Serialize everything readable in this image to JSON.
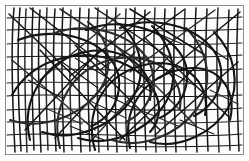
{
  "artwork": {
    "title": "Abstract Scribble Drawing",
    "medium": "black ink line drawing",
    "description": "Dense overlapping network of straight and curved black ink strokes filling a thin rectangular frame",
    "canvas": {
      "width": 249,
      "height": 161
    },
    "background_color": "#fdfdfc",
    "ink_color": "#141414",
    "frame": {
      "stroke_color": "#8e8e8e",
      "fill_color": "#fcfcfb",
      "x": 5.5,
      "y": 5.5,
      "width": 238,
      "height": 149
    },
    "strokes": {
      "vertical_bundle": [
        "M 14 8 C 11 40, 12 95, 15 152",
        "M 20 8 C 17 45, 18 100, 21 151",
        "M 26 9 C 24 50, 25 105, 27 152",
        "M 33 8 C 31 48, 32 100, 34 150",
        "M 40 10 C 37 52, 39 108, 41 152",
        "M 47 8 C 45 46, 46 100, 48 150",
        "M 55 9 C 52 50, 54 104, 56 151",
        "M 63 8 C 61 44, 62 98, 64 152",
        "M 71 10 C 69 52, 70 106, 72 150",
        "M 80 8 C 78 46, 79 102, 81 152",
        "M 89 9 C 87 50, 88 104, 90 151",
        "M 98 8 C 96 48, 97 100, 99 152",
        "M 107 10 C 105 52, 106 106, 108 150",
        "M 116 8 C 114 46, 115 100, 117 152",
        "M 126 9 C 124 50, 125 104, 127 151",
        "M 135 8 C 133 48, 134 102, 136 152",
        "M 145 10 C 143 52, 144 106, 146 150",
        "M 155 8 C 153 46, 154 100, 156 152",
        "M 165 9 C 163 50, 164 104, 166 151",
        "M 175 8 C 173 48, 174 102, 176 152",
        "M 185 10 C 183 52, 184 106, 186 150",
        "M 196 8 C 194 46, 195 100, 197 152",
        "M 207 9 C 205 50, 206 104, 208 151",
        "M 218 8 C 216 48, 217 102, 219 152",
        "M 229 10 C 227 52, 228 106, 230 150",
        "M 238 9 C 236 50, 237 104, 239 151"
      ],
      "horizontal_bundle": [
        "M 7 18 C 60 15, 150 22, 242 17",
        "M 7 30 C 70 27, 160 34, 242 29",
        "M 7 44 C 55 40, 140 48, 242 43",
        "M 7 57 C 80 54, 170 61, 242 55",
        "M 7 70 C 60 66, 150 74, 242 69",
        "M 7 83 C 75 80, 165 87, 242 82",
        "M 7 96 C 55 92, 145 100, 242 95",
        "M 7 110 C 80 106, 170 114, 242 108",
        "M 7 122 C 60 119, 150 127, 242 121",
        "M 7 135 C 75 131, 165 140, 242 134",
        "M 7 146 C 60 143, 150 150, 242 145"
      ],
      "diagonal_strokes": [
        "M 9 14 L 78 80",
        "M 30 8 L 110 70",
        "M 60 9 L 140 62",
        "M 95 8 L 170 58",
        "M 130 9 L 205 55",
        "M 12 60 L 95 130",
        "M 40 50 L 125 140",
        "M 75 45 L 160 130",
        "M 110 40 L 195 125",
        "M 145 38 L 230 118",
        "M 240 12 L 160 78",
        "M 215 10 L 130 72",
        "M 185 9 L 100 70",
        "M 150 12 L 70 76",
        "M 120 14 L 40 80",
        "M 238 62 L 155 135",
        "M 205 58 L 120 140",
        "M 170 55 L 90 142",
        "M 135 52 L 55 138",
        "M 100 50 L 25 130"
      ],
      "curve_loops": [
        "M 12 95 C 35 55, 85 48, 120 62 C 155 76, 170 110, 150 132",
        "M 30 140 C 20 100, 45 60, 85 52 C 125 44, 155 70, 150 100",
        "M 60 148 C 50 110, 70 70, 110 60 C 150 50, 185 72, 180 108",
        "M 95 150 C 85 115, 100 78, 140 66 C 180 54, 212 80, 205 115",
        "M 130 148 C 122 112, 140 80, 178 70 C 216 60, 238 88, 230 120",
        "M 10 120 C 40 130, 75 118, 95 96 C 115 74, 112 40, 88 22",
        "M 42 132 C 72 142, 108 128, 128 104 C 148 80, 144 46, 120 24",
        "M 78 138 C 108 148, 144 132, 162 108 C 180 84, 176 50, 152 26",
        "M 112 140 C 142 150, 178 134, 196 110 C 214 86, 210 52, 186 28",
        "M 150 142 C 180 150, 214 132, 228 108 C 240 86, 236 54, 214 32",
        "M 18 40 C 48 28, 88 34, 108 56 C 128 78, 120 112, 92 126",
        "M 52 34 C 82 22, 122 30, 142 52 C 162 74, 154 108, 126 122",
        "M 86 30 C 116 18, 156 26, 176 48 C 196 70, 188 104, 160 118",
        "M 120 28 C 150 16, 190 24, 210 46 C 230 68, 222 102, 194 116"
      ],
      "short_marks": [
        "M 62 62 L 98 88",
        "M 75 58 L 108 78",
        "M 88 100 L 126 118",
        "M 100 92 L 138 110",
        "M 118 74 L 152 92",
        "M 140 110 L 178 126",
        "M 160 66 L 196 86",
        "M 180 120 L 214 134",
        "M 45 108 L 82 124",
        "M 28 80 L 62 98",
        "M 198 40 L 228 60",
        "M 210 90 L 238 104",
        "M 150 30 L 182 44",
        "M 70 126 L 104 140"
      ]
    }
  }
}
